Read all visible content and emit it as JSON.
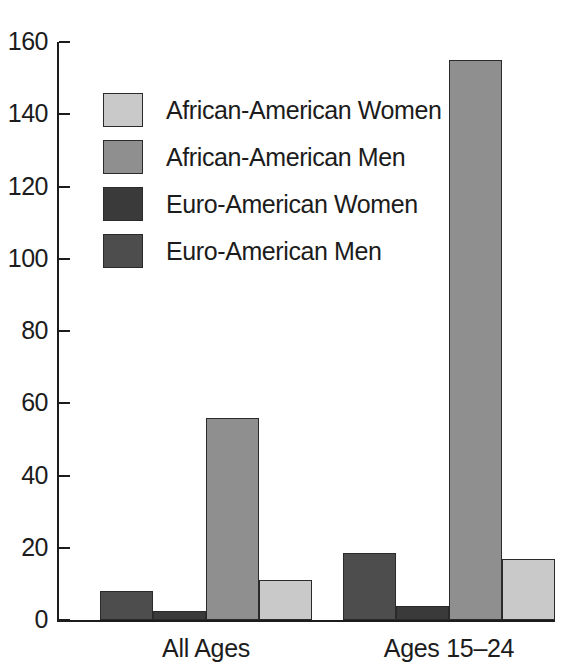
{
  "chart_data": {
    "type": "bar",
    "title": "",
    "subtitle": "",
    "xlabel": "",
    "ylabel": "",
    "categories": [
      "All Ages",
      "Ages 15–24"
    ],
    "ylim": [
      0,
      160
    ],
    "y_ticks": [
      0,
      20,
      40,
      60,
      80,
      100,
      120,
      140,
      160
    ],
    "y_tick_labels": [
      "0",
      "20",
      "40",
      "60",
      "80",
      "100",
      "120",
      "140",
      "160"
    ],
    "grid": false,
    "legend_position": "upper-left-inside",
    "bar_draw_order": [
      "Euro-American Men",
      "Euro-American Women",
      "African-American Men",
      "African-American Women"
    ],
    "series": [
      {
        "name": "African-American Women",
        "color": "#c9c9c9",
        "values": [
          11,
          17
        ]
      },
      {
        "name": "African-American Men",
        "color": "#8f8f8f",
        "values": [
          56,
          155
        ]
      },
      {
        "name": "Euro-American Women",
        "color": "#3a3a3a",
        "values": [
          2.5,
          4
        ]
      },
      {
        "name": "Euro-American Men",
        "color": "#4d4d4d",
        "values": [
          8,
          18.5
        ]
      }
    ]
  },
  "legend": {
    "items": [
      {
        "label": "African-American Women",
        "color": "#c9c9c9"
      },
      {
        "label": "African-American Men",
        "color": "#8f8f8f"
      },
      {
        "label": "Euro-American Women",
        "color": "#3a3a3a"
      },
      {
        "label": "Euro-American Men",
        "color": "#4d4d4d"
      }
    ]
  },
  "axis": {
    "y_labels": [
      "160",
      "140",
      "120",
      "100",
      "80",
      "60",
      "40",
      "20",
      "0"
    ],
    "x_labels": [
      "All Ages",
      "Ages 15–24"
    ]
  }
}
